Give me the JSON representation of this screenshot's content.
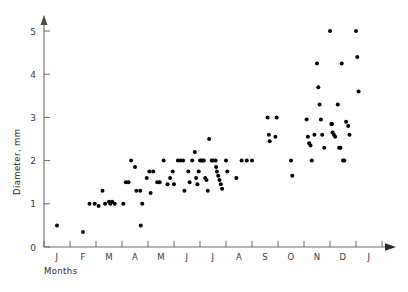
{
  "chart_data": {
    "type": "scatter",
    "title": "",
    "xlabel": "Months",
    "ylabel": "Diameter, mm",
    "xlim": [
      0,
      13
    ],
    "ylim": [
      0,
      5.3
    ],
    "ytick_values": [
      0,
      1,
      2,
      3,
      4,
      5
    ],
    "ytick_labels": [
      "0",
      "1",
      "2",
      "3",
      "4",
      "5"
    ],
    "xtick_labels": [
      "J",
      "F",
      "M",
      "A",
      "M",
      "J",
      "J",
      "A",
      "S",
      "O",
      "N",
      "D",
      "J"
    ],
    "grid": false,
    "legend": null,
    "marker": "filled-circle",
    "marker_color": "#000000",
    "points": [
      [
        0.5,
        0.5
      ],
      [
        1.5,
        0.35
      ],
      [
        1.75,
        1.0
      ],
      [
        1.95,
        1.0
      ],
      [
        2.1,
        0.95
      ],
      [
        2.25,
        1.3
      ],
      [
        2.35,
        1.0
      ],
      [
        2.5,
        1.05
      ],
      [
        2.55,
        1.0
      ],
      [
        2.62,
        1.05
      ],
      [
        2.72,
        1.0
      ],
      [
        3.05,
        1.0
      ],
      [
        3.15,
        1.5
      ],
      [
        3.25,
        1.5
      ],
      [
        3.35,
        2.0
      ],
      [
        3.5,
        1.85
      ],
      [
        3.55,
        1.3
      ],
      [
        3.7,
        1.3
      ],
      [
        3.72,
        0.5
      ],
      [
        3.78,
        1.0
      ],
      [
        3.95,
        1.6
      ],
      [
        4.05,
        1.75
      ],
      [
        4.1,
        1.25
      ],
      [
        4.2,
        1.75
      ],
      [
        4.35,
        1.5
      ],
      [
        4.45,
        1.5
      ],
      [
        4.6,
        2.0
      ],
      [
        4.75,
        1.45
      ],
      [
        4.85,
        1.6
      ],
      [
        4.95,
        1.75
      ],
      [
        5.0,
        1.45
      ],
      [
        5.15,
        2.0
      ],
      [
        5.25,
        2.0
      ],
      [
        5.35,
        2.0
      ],
      [
        5.4,
        1.3
      ],
      [
        5.55,
        1.75
      ],
      [
        5.6,
        1.5
      ],
      [
        5.7,
        2.0
      ],
      [
        5.8,
        2.2
      ],
      [
        5.85,
        1.6
      ],
      [
        5.9,
        1.45
      ],
      [
        5.95,
        1.75
      ],
      [
        6.0,
        2.0
      ],
      [
        6.05,
        2.0
      ],
      [
        6.1,
        2.0
      ],
      [
        6.15,
        2.0
      ],
      [
        6.2,
        1.6
      ],
      [
        6.25,
        1.55
      ],
      [
        6.3,
        1.3
      ],
      [
        6.35,
        2.5
      ],
      [
        6.45,
        2.0
      ],
      [
        6.5,
        2.0
      ],
      [
        6.6,
        2.0
      ],
      [
        6.62,
        1.85
      ],
      [
        6.65,
        1.75
      ],
      [
        6.7,
        1.65
      ],
      [
        6.75,
        1.55
      ],
      [
        6.8,
        1.45
      ],
      [
        6.85,
        1.35
      ],
      [
        7.0,
        2.0
      ],
      [
        7.05,
        1.75
      ],
      [
        7.4,
        1.6
      ],
      [
        7.6,
        2.0
      ],
      [
        7.8,
        2.0
      ],
      [
        8.0,
        2.0
      ],
      [
        8.6,
        3.0
      ],
      [
        8.65,
        2.6
      ],
      [
        8.68,
        2.45
      ],
      [
        8.95,
        3.0
      ],
      [
        8.9,
        2.55
      ],
      [
        9.5,
        2.0
      ],
      [
        9.55,
        1.65
      ],
      [
        10.1,
        2.95
      ],
      [
        10.15,
        2.55
      ],
      [
        10.2,
        2.4
      ],
      [
        10.25,
        2.35
      ],
      [
        10.3,
        2.0
      ],
      [
        10.4,
        2.6
      ],
      [
        10.5,
        4.25
      ],
      [
        10.55,
        3.7
      ],
      [
        10.6,
        3.3
      ],
      [
        10.65,
        2.95
      ],
      [
        10.7,
        2.6
      ],
      [
        10.78,
        2.3
      ],
      [
        11.0,
        5.0
      ],
      [
        11.05,
        2.85
      ],
      [
        11.08,
        2.85
      ],
      [
        11.1,
        2.65
      ],
      [
        11.15,
        2.6
      ],
      [
        11.2,
        2.55
      ],
      [
        11.3,
        3.3
      ],
      [
        11.35,
        2.3
      ],
      [
        11.4,
        2.3
      ],
      [
        11.45,
        4.25
      ],
      [
        11.5,
        2.0
      ],
      [
        11.55,
        2.0
      ],
      [
        11.62,
        2.9
      ],
      [
        11.7,
        2.8
      ],
      [
        11.75,
        2.6
      ],
      [
        12.0,
        5.0
      ],
      [
        12.05,
        4.4
      ],
      [
        12.1,
        3.6
      ]
    ]
  },
  "axes": {
    "y_title": "Diameter, mm",
    "x_title": "Months",
    "y_ticks": [
      {
        "label": "5",
        "value": 5
      },
      {
        "label": "4",
        "value": 4
      },
      {
        "label": "3",
        "value": 3
      },
      {
        "label": "2",
        "value": 2
      },
      {
        "label": "1",
        "value": 1
      },
      {
        "label": "0",
        "value": 0
      }
    ],
    "x_months": [
      {
        "label": "J"
      },
      {
        "label": "F"
      },
      {
        "label": "M"
      },
      {
        "label": "A"
      },
      {
        "label": "M"
      },
      {
        "label": "J"
      },
      {
        "label": "J"
      },
      {
        "label": "A"
      },
      {
        "label": "S"
      },
      {
        "label": "O"
      },
      {
        "label": "N"
      },
      {
        "label": "D"
      },
      {
        "label": "J"
      }
    ]
  }
}
